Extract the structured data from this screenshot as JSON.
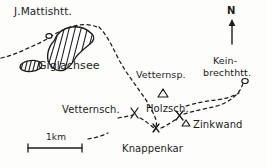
{
  "map": {
    "title": "Giglachsee hiking sketch map",
    "style": "hand-drawn pen sketch",
    "ink_color": "#1c1c1c",
    "paper_color": "#fdfdfc",
    "north_arrow": {
      "label": "N",
      "name": "north-arrow"
    },
    "scale_bar": {
      "label": "1km",
      "name": "scale-bar"
    },
    "labels": [
      {
        "id": "mattis-hut",
        "text": "J.Mattishtt.",
        "x": 14,
        "y": 8,
        "class": "lbl-hut"
      },
      {
        "id": "giglachsee",
        "text": "Giglachsee",
        "x": 38,
        "y": 62,
        "class": "lbl-lake"
      },
      {
        "id": "vetternspitze",
        "text": "Vetternsp.",
        "x": 138,
        "y": 71,
        "class": "lbl-peak"
      },
      {
        "id": "keinprecht-1",
        "text": "Kein-",
        "x": 216,
        "y": 58,
        "class": "lbl-two-line"
      },
      {
        "id": "keinprecht-2",
        "text": "brechthtt.",
        "x": 206,
        "y": 70,
        "class": "lbl-two-line"
      },
      {
        "id": "vetternscharte",
        "text": "Vetternsch.",
        "x": 64,
        "y": 107,
        "class": "lbl-place"
      },
      {
        "id": "holzscharte",
        "text": "Holzsch.",
        "x": 148,
        "y": 106,
        "class": "lbl-place"
      },
      {
        "id": "zinkwand",
        "text": "Zinkwand",
        "x": 192,
        "y": 127,
        "class": "lbl-place"
      },
      {
        "id": "knappenkar",
        "text": "Knappenkar",
        "x": 123,
        "y": 145,
        "class": "lbl-place"
      }
    ],
    "features": {
      "lake": {
        "name": "giglachsee-lake",
        "hatched": true
      },
      "small_pond": {
        "name": "small-hatched-pond",
        "hatched": true
      },
      "peak_markers": [
        {
          "name": "peak-marker-vetternspitze"
        },
        {
          "name": "peak-marker-holzscharte"
        },
        {
          "name": "peak-marker-zinkwand"
        }
      ],
      "trail_junctions": [
        {
          "name": "trail-junction-vetternscharte"
        },
        {
          "name": "trail-junction-holzscharte"
        }
      ],
      "trails": {
        "name": "dashed-trail-network",
        "style": "dashed"
      }
    }
  }
}
